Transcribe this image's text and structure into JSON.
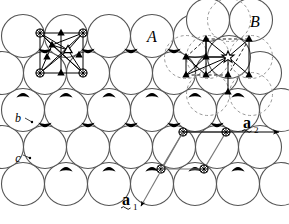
{
  "figure": {
    "type": "crystal-structure-diagram",
    "background_color": "#ffffff",
    "line_color": "#000000",
    "sphere_fill": "#ffffff",
    "sphere_stroke": "#555555",
    "dashed_stroke": "#888888",
    "interstice_fill": "#000000",
    "canvas": {
      "width": 289,
      "height": 224
    }
  },
  "labels": {
    "sphere_A": "A",
    "sphere_B": "B",
    "layer_b": "b",
    "layer_c": "c",
    "vector_a1_base": "a",
    "vector_a1_sub": "1",
    "vector_a2_base": "a",
    "vector_a2_sub": "2"
  },
  "geometry": {
    "sphere_radius": 21.5,
    "row_spacing": 37,
    "col_spacing": 43,
    "rows": [
      {
        "name": "row-top-A",
        "y": 36,
        "x_start": 23,
        "count": 6,
        "offset": 0
      },
      {
        "name": "row-second-B",
        "y": 73,
        "x_start": 2,
        "count": 7,
        "offset": -21.5
      },
      {
        "name": "row-third-b",
        "y": 110,
        "x_start": 23,
        "count": 6,
        "offset": 0
      },
      {
        "name": "row-fourth-c",
        "y": 147,
        "x_start": 2,
        "count": 7,
        "offset": -21.5
      },
      {
        "name": "row-bottom",
        "y": 184,
        "x_start": 23,
        "count": 6,
        "offset": 0
      }
    ],
    "overlay_spheres_top_right": [
      {
        "cx": 208,
        "cy": 20,
        "r": 21.5,
        "style": "solid"
      },
      {
        "cx": 251,
        "cy": 20,
        "r": 21.5,
        "style": "solid"
      },
      {
        "cx": 229,
        "cy": 57,
        "r": 21.5,
        "style": "solid"
      },
      {
        "cx": 186,
        "cy": 57,
        "r": 21.5,
        "style": "dashed"
      },
      {
        "cx": 229,
        "cy": 20,
        "r": 21.5,
        "style": "dashed"
      },
      {
        "cx": 208,
        "cy": 57,
        "r": 21.5,
        "style": "dashed"
      },
      {
        "cx": 251,
        "cy": 57,
        "r": 21.5,
        "style": "dashed"
      }
    ]
  },
  "markers": {
    "octahedral_site_symbol": "open-triangle",
    "tetrahedral_site_symbol": "filled-triangle",
    "atom_center_symbol": "spoked-circle",
    "lattice_point_symbol": "spoked-circle",
    "cluster_left": {
      "name": "octahedral-cluster",
      "spoked_circles": [
        {
          "cx": 40,
          "cy": 33
        },
        {
          "cx": 83,
          "cy": 33
        },
        {
          "cx": 40,
          "cy": 73
        },
        {
          "cx": 83,
          "cy": 73
        }
      ],
      "open_triangle": {
        "cx": 68,
        "cy": 50
      },
      "filled_triangles": [
        {
          "cx": 61,
          "cy": 33
        },
        {
          "cx": 47,
          "cy": 57
        },
        {
          "cx": 61,
          "cy": 73
        },
        {
          "cx": 79,
          "cy": 55
        },
        {
          "cx": 52,
          "cy": 45
        }
      ]
    },
    "cluster_right": {
      "name": "tetrahedral-cluster",
      "open_star": {
        "cx": 228,
        "cy": 57
      },
      "filled_triangles": [
        {
          "cx": 206,
          "cy": 39
        },
        {
          "cx": 249,
          "cy": 39
        },
        {
          "cx": 186,
          "cy": 57
        },
        {
          "cx": 206,
          "cy": 75
        },
        {
          "cx": 228,
          "cy": 75
        },
        {
          "cx": 249,
          "cy": 75
        },
        {
          "cx": 186,
          "cy": 75
        },
        {
          "cx": 206,
          "cy": 57
        },
        {
          "cx": 228,
          "cy": 92
        }
      ]
    },
    "unit_cell_bottom_right": {
      "name": "unit-cell-parallelogram",
      "points": [
        {
          "cx": 183,
          "cy": 132
        },
        {
          "cx": 226,
          "cy": 132
        },
        {
          "cx": 161,
          "cy": 169
        },
        {
          "cx": 204,
          "cy": 169
        }
      ]
    }
  },
  "vectors": {
    "a1": {
      "from": {
        "x": 183,
        "y": 132
      },
      "to": {
        "x": 140,
        "y": 209
      },
      "label_x": 123,
      "label_y": 200
    },
    "a2": {
      "from": {
        "x": 183,
        "y": 132
      },
      "to": {
        "x": 282,
        "y": 132
      },
      "label_x": 243,
      "label_y": 124
    }
  }
}
